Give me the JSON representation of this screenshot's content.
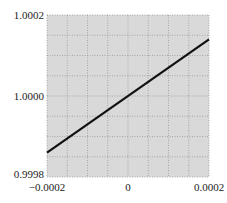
{
  "chart_data": {
    "type": "line",
    "title": "",
    "xlabel": "",
    "ylabel": "",
    "xlim": [
      -0.0002,
      0.0002
    ],
    "ylim": [
      0.9998,
      1.0002
    ],
    "grid": true,
    "grid_divisions": {
      "x": 8,
      "y": 8
    },
    "x_ticks": [
      {
        "value": -0.0002,
        "label": "−0.0002"
      },
      {
        "value": 0,
        "label": "0"
      },
      {
        "value": 0.0002,
        "label": "0.0002"
      }
    ],
    "y_ticks": [
      {
        "value": 0.9998,
        "label": "0.9998"
      },
      {
        "value": 1.0,
        "label": "1.0000"
      },
      {
        "value": 1.0002,
        "label": "1.0002"
      }
    ],
    "series": [
      {
        "name": "line",
        "x": [
          -0.0002,
          0.0002
        ],
        "y": [
          0.99986,
          1.00014
        ],
        "color": "#111111"
      }
    ],
    "legend": null
  },
  "colors": {
    "plot_background": "#d9d9d9",
    "grid": "#9a9a9a",
    "line": "#111111"
  }
}
